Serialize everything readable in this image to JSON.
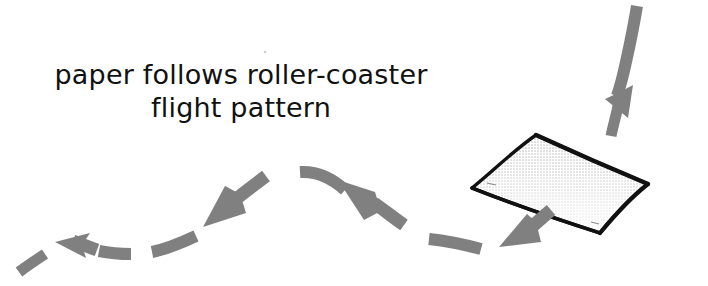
{
  "figure": {
    "kind": "hand-drawn-instruction-diagram",
    "background_color": "#ffffff",
    "caption": {
      "line1": "paper follows roller-coaster",
      "line2": "flight pattern",
      "full_text": "paper follows roller-coaster flight pattern",
      "color": "#111111",
      "font_size_px": 27,
      "line2_font_size_px": 27,
      "align": "center"
    },
    "colors": {
      "arrow_gray": "#808080",
      "arrow_gray_light": "#8d8d8d",
      "paper_outline": "#111111",
      "paper_fill": "#ffffff",
      "paper_shade_top": "#7a7a7a",
      "ink_black": "#111111"
    },
    "paper_sheet": {
      "label": "sheet-of-paper",
      "description": "slightly warped quadrilateral sheet seen in perspective, black outline, white face, halftone gray shading fading down from the top-right edge",
      "corners": {
        "left": "472,188",
        "top": "538,134",
        "right": "648,184",
        "bottom": "600,233"
      }
    },
    "flight_path": {
      "description": "dashed gray arrow trajectory reading right-to-left: steep dive from upper right into the paper, down below the paper, up over a hill crest, then down and out to the left",
      "direction": "right-to-left",
      "segment_count": 11,
      "segments": [
        {
          "name": "dive-shaft-dash",
          "type": "dash",
          "note": "long shaft descending from top-right corner"
        },
        {
          "name": "dive-arrowhead",
          "type": "arrow",
          "note": "arrowhead pointing down, just above paper"
        },
        {
          "name": "dive-tail-dash",
          "type": "dash",
          "note": "short dash between arrowhead and paper top"
        },
        {
          "name": "post-paper-arrow",
          "type": "arrow",
          "note": "arrow pointing down-left below the paper"
        },
        {
          "name": "valley-dash-right",
          "type": "dash",
          "note": "curved dash in the right valley"
        },
        {
          "name": "climb-arrow",
          "type": "arrow",
          "note": "arrow pointing up-left climbing the hill"
        },
        {
          "name": "crest-dash",
          "type": "dash",
          "note": "curved dash arcing over the hill crest"
        },
        {
          "name": "descend-arrow",
          "type": "arrow",
          "note": "arrow pointing down-left off the crest"
        },
        {
          "name": "valley-dash-left-upper",
          "type": "dash",
          "note": "curved dash descending left"
        },
        {
          "name": "exit-arrow",
          "type": "arrow",
          "note": "arrow pointing up-left at far left"
        },
        {
          "name": "exit-tail-dash",
          "type": "dash",
          "note": "small dash at the extreme left edge"
        }
      ]
    }
  }
}
